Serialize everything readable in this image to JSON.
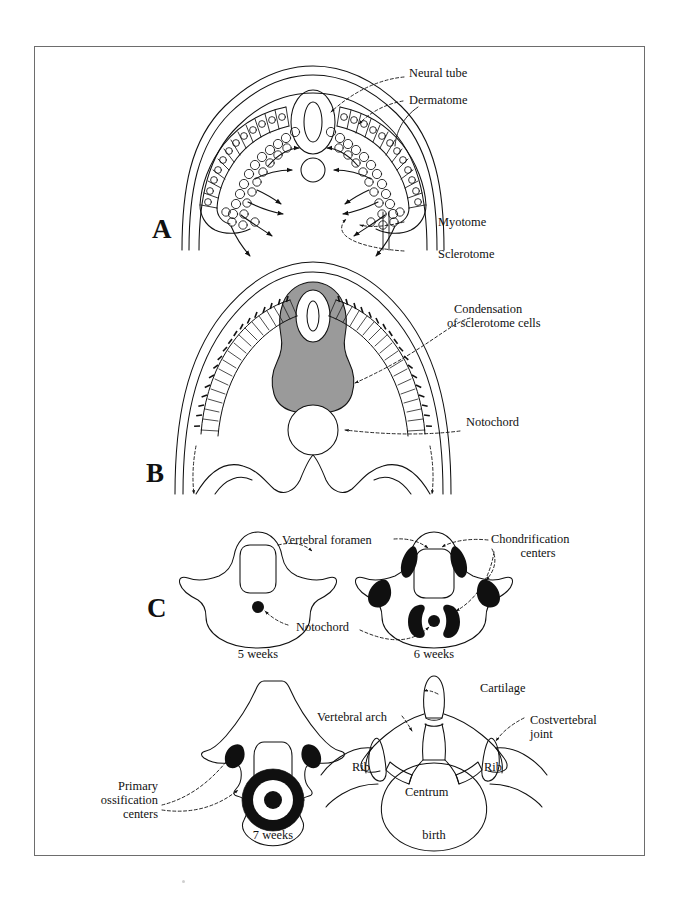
{
  "figure": {
    "title_visible": false,
    "border_color": "#6d6d6d",
    "background": "#ffffff",
    "ink_color": "#111111",
    "gray_fill": "#9a9a9a",
    "black_fill": "#101010"
  },
  "panels": [
    {
      "letter": "A",
      "caption": "",
      "labels": [
        {
          "key": "neural_tube",
          "text": "Neural tube"
        },
        {
          "key": "dermatome",
          "text": "Dermatome"
        },
        {
          "key": "myotome",
          "text": "Myotome"
        },
        {
          "key": "sclerotome",
          "text": "Sclerotome"
        }
      ]
    },
    {
      "letter": "B",
      "caption": "",
      "labels": [
        {
          "key": "condensation_line1",
          "text": "Condensation"
        },
        {
          "key": "condensation_line2",
          "text": "of sclerotome cells"
        },
        {
          "key": "notochord",
          "text": "Notochord"
        }
      ]
    },
    {
      "letter": "C",
      "caption": "",
      "labels": [
        {
          "key": "vertebral_foramen",
          "text": "Vertebral foramen"
        },
        {
          "key": "chondrification_line1",
          "text": "Chondrification"
        },
        {
          "key": "chondrification_line2",
          "text": "centers"
        },
        {
          "key": "notochord",
          "text": "Notochord"
        },
        {
          "key": "primary_line1",
          "text": "Primary"
        },
        {
          "key": "primary_line2",
          "text": "ossification"
        },
        {
          "key": "primary_line3",
          "text": "centers"
        },
        {
          "key": "cartilage",
          "text": "Cartilage"
        },
        {
          "key": "vertebral_arch",
          "text": "Vertebral arch"
        },
        {
          "key": "costvertebral_line1",
          "text": "Costvertebral"
        },
        {
          "key": "costvertebral_line2",
          "text": "joint"
        },
        {
          "key": "rib_left",
          "text": "Rib"
        },
        {
          "key": "rib_right",
          "text": "Rib"
        },
        {
          "key": "centrum",
          "text": "Centrum"
        }
      ],
      "stages": [
        {
          "key": "five_weeks",
          "text": "5 weeks"
        },
        {
          "key": "six_weeks",
          "text": "6 weeks"
        },
        {
          "key": "seven_weeks",
          "text": "7 weeks"
        },
        {
          "key": "birth",
          "text": "birth"
        }
      ]
    }
  ],
  "letters": {
    "a": "A",
    "b": "B",
    "c": "C"
  }
}
